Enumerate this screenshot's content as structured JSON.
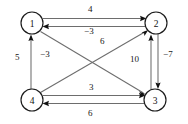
{
  "diagram": {
    "type": "directed-weighted-graph",
    "background_color": "#ffffff",
    "edge_color": "#6d6d6d",
    "node_stroke_color": "#1a1a1a",
    "text_color": "#171717",
    "nodes": [
      {
        "id": "1",
        "label": "1",
        "cx": 32,
        "cy": 23,
        "r": 11
      },
      {
        "id": "2",
        "label": "2",
        "cx": 156,
        "cy": 23,
        "r": 11
      },
      {
        "id": "3",
        "label": "3",
        "cx": 155,
        "cy": 100,
        "r": 11
      },
      {
        "id": "4",
        "label": "4",
        "cx": 32,
        "cy": 100,
        "r": 11
      }
    ],
    "edges": [
      {
        "id": "e-1-2",
        "from": "1",
        "to": "2",
        "weight": "4",
        "label_x": 88,
        "label_y": 5
      },
      {
        "id": "e-2-1",
        "from": "2",
        "to": "1",
        "weight": "−3",
        "label_x": 86,
        "label_y": 25
      },
      {
        "id": "e-4-1",
        "from": "4",
        "to": "1",
        "weight": "5",
        "label_x": 16,
        "label_y": 55
      },
      {
        "id": "e-1-3",
        "from": "1",
        "to": "3",
        "weight": "−3",
        "label_x": 41,
        "label_y": 51
      },
      {
        "id": "e-4-2",
        "from": "4",
        "to": "2",
        "weight": "6",
        "label_x": 101,
        "label_y": 38
      },
      {
        "id": "e-3-2",
        "from": "3",
        "to": "2",
        "weight": "10",
        "label_x": 131,
        "label_y": 57
      },
      {
        "id": "e-2-3",
        "from": "2",
        "to": "3",
        "weight": "−7",
        "label_x": 163,
        "label_y": 52
      },
      {
        "id": "e-4-3",
        "from": "4",
        "to": "3",
        "weight": "3",
        "label_x": 89,
        "label_y": 84
      },
      {
        "id": "e-3-4",
        "from": "3",
        "to": "4",
        "weight": "6",
        "label_x": 88,
        "label_y": 110
      }
    ]
  }
}
